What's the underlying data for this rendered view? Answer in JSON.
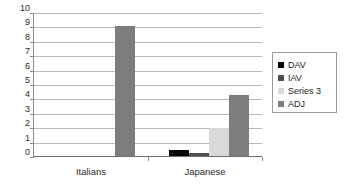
{
  "chart_data": {
    "type": "bar",
    "title": "",
    "subtitle": "",
    "xlabel": "",
    "ylabel": "",
    "categories": [
      "Italians",
      "Japanese"
    ],
    "series": [
      {
        "name": "DAV",
        "color": "#070707",
        "values": [
          0.05,
          0.5
        ]
      },
      {
        "name": "IAV",
        "color": "#4f4f4f",
        "values": [
          0.05,
          0.3
        ]
      },
      {
        "name": "Series 3",
        "color": "#d9d9d9",
        "values": [
          0.05,
          2.0
        ]
      },
      {
        "name": "ADJ",
        "color": "#7d7d7d",
        "values": [
          9.1,
          4.3
        ]
      }
    ],
    "ylim": [
      0,
      10
    ],
    "ytick_labels": [
      "10",
      "9",
      "8",
      "7",
      "6",
      "5",
      "4",
      "3",
      "2",
      "1",
      "0"
    ],
    "ytick_values": [
      10,
      9,
      8,
      7,
      6,
      5,
      4,
      3,
      2,
      1,
      0
    ],
    "grid": true,
    "grid_axis": "y",
    "legend_position": "right",
    "legend_entries": [
      "DAV",
      "IAV",
      "Series 3",
      "ADJ"
    ],
    "annotations": []
  },
  "axes": {
    "y": {
      "ticks": [
        {
          "label": "10",
          "value": 10
        },
        {
          "label": "9",
          "value": 9
        },
        {
          "label": "8",
          "value": 8
        },
        {
          "label": "7",
          "value": 7
        },
        {
          "label": "6",
          "value": 6
        },
        {
          "label": "5",
          "value": 5
        },
        {
          "label": "4",
          "value": 4
        },
        {
          "label": "3",
          "value": 3
        },
        {
          "label": "2",
          "value": 2
        },
        {
          "label": "1",
          "value": 1
        },
        {
          "label": "0",
          "value": 0
        }
      ]
    },
    "x": {
      "categories": [
        {
          "label": "Italians"
        },
        {
          "label": "Japanese"
        }
      ]
    }
  },
  "legend": {
    "items": [
      {
        "label": "DAV",
        "color": "#070707"
      },
      {
        "label": "IAV",
        "color": "#4f4f4f"
      },
      {
        "label": "Series 3",
        "color": "#d9d9d9"
      },
      {
        "label": "ADJ",
        "color": "#7d7d7d"
      }
    ]
  }
}
